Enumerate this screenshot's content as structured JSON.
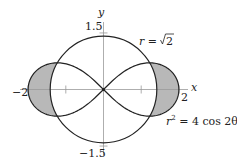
{
  "figure": {
    "type": "polar-curves",
    "curves": [
      {
        "name": "circle",
        "equation": "r = √2",
        "label_main": "r = ",
        "label_sqrt": "2",
        "radius": 1.41421356
      },
      {
        "name": "lemniscate",
        "equation": "r² = 4 cos 2θ",
        "label_r": "r",
        "label_exp": "2",
        "label_rest": " = 4 cos 2θ"
      }
    ],
    "shaded_region": "inside lemniscate, outside circle",
    "shade_color": "#b8b8b8",
    "axes": {
      "x_label": "x",
      "y_label": "y",
      "x_ticks": [
        {
          "value": -2,
          "label": "−2"
        },
        {
          "value": -1,
          "label": ""
        },
        {
          "value": 1,
          "label": ""
        },
        {
          "value": 2,
          "label": "2"
        }
      ],
      "y_ticks": [
        {
          "value": 1.5,
          "label": "1.5"
        },
        {
          "value": -1.5,
          "label": "−1.5"
        }
      ],
      "axis_color": "#999999",
      "curve_color": "#222222"
    }
  }
}
